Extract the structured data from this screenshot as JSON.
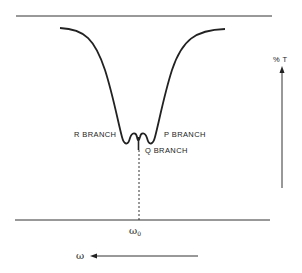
{
  "diagram": {
    "labels": {
      "r_branch": "R BRANCH",
      "p_branch": "P BRANCH",
      "q_branch": "Q BRANCH",
      "y_axis": "% T",
      "center": "ω",
      "center_sub": "0",
      "x_direction": "ω"
    },
    "colors": {
      "line": "#222222",
      "background": "#ffffff"
    }
  }
}
